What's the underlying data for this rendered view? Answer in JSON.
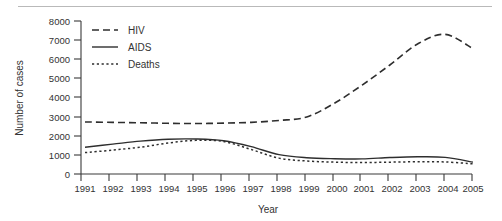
{
  "chart_data": {
    "type": "line",
    "title": "",
    "xlabel": "Year",
    "ylabel": "Number of cases",
    "x": [
      1991,
      1992,
      1993,
      1994,
      1995,
      1996,
      1997,
      1998,
      1999,
      2000,
      2001,
      2002,
      2003,
      2004,
      2005
    ],
    "categories": [
      "1991",
      "1992",
      "1993",
      "1994",
      "1995",
      "1996",
      "1997",
      "1998",
      "1999",
      "2000",
      "2001",
      "2002",
      "2003",
      "2004",
      "2005"
    ],
    "xlim": [
      1991,
      2005
    ],
    "ylim": [
      0,
      8000
    ],
    "yticks": [
      0,
      1000,
      2000,
      3000,
      4000,
      5000,
      6000,
      7000,
      8000
    ],
    "ytick_labels": [
      "0",
      "1000",
      "2000",
      "3000",
      "4000",
      "5000",
      "6000",
      "7000",
      "8000"
    ],
    "xtick_labels": [
      "1991",
      "1992",
      "1993",
      "1994",
      "1995",
      "1996",
      "1997",
      "1998",
      "1999",
      "2000",
      "2001",
      "2002",
      "2003",
      "2004",
      "2005"
    ],
    "grid": false,
    "legend_position": "top-left-inside",
    "series": [
      {
        "name": "HIV",
        "style": "dashed",
        "color": "#2e2e2e",
        "values": [
          2720,
          2700,
          2680,
          2650,
          2640,
          2660,
          2700,
          2800,
          2980,
          3700,
          4650,
          5700,
          6800,
          7300,
          6550
        ]
      },
      {
        "name": "AIDS",
        "style": "solid",
        "color": "#2e2e2e",
        "values": [
          1400,
          1560,
          1720,
          1820,
          1830,
          1740,
          1430,
          1010,
          850,
          800,
          790,
          860,
          900,
          870,
          620
        ]
      },
      {
        "name": "Deaths",
        "style": "dotted",
        "color": "#2e2e2e",
        "values": [
          1120,
          1250,
          1400,
          1620,
          1760,
          1700,
          1280,
          830,
          680,
          620,
          600,
          620,
          640,
          630,
          530
        ]
      }
    ]
  },
  "legend": {
    "items": [
      {
        "label": "HIV",
        "style": "dashed"
      },
      {
        "label": "AIDS",
        "style": "solid"
      },
      {
        "label": "Deaths",
        "style": "dotted"
      }
    ]
  },
  "axes": {
    "y_title": "Number of cases",
    "x_title": "Year"
  }
}
